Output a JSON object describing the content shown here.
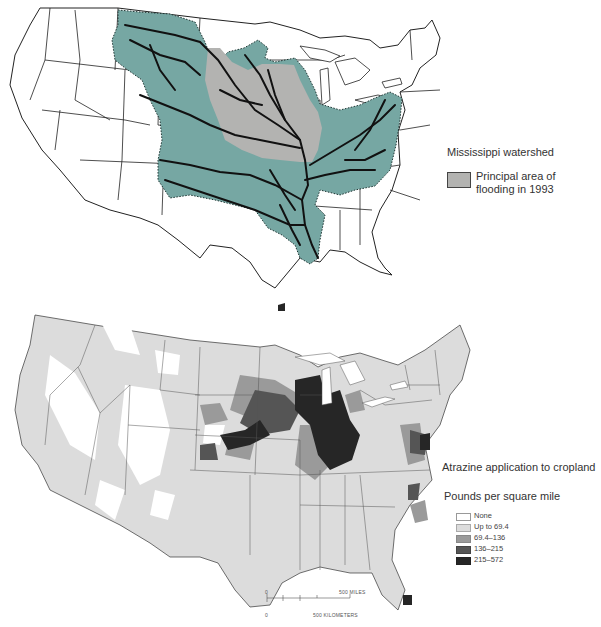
{
  "top_map": {
    "title": "Mississippi watershed",
    "legend": {
      "watershed_label": "Mississippi watershed",
      "flood_label_line1": "Principal area of",
      "flood_label_line2": "flooding in 1993"
    },
    "colors": {
      "watershed": "#76a7a3",
      "flood_area": "#b3b3b1",
      "rivers": "#111111",
      "borders": "#222222"
    }
  },
  "bottom_map": {
    "title": "Atrazine application to cropland",
    "subtitle": "Pounds per square mile",
    "legend": [
      {
        "label": "None",
        "color": "#ffffff"
      },
      {
        "label": "Up to 69.4",
        "color": "#dcdcdc"
      },
      {
        "label": "69.4–136",
        "color": "#9a9a9a"
      },
      {
        "label": "136–215",
        "color": "#555555"
      },
      {
        "label": "215–572",
        "color": "#262626"
      }
    ],
    "scale_bar": {
      "miles_zero": "0",
      "miles_label": "500 MILES",
      "km_zero": "0",
      "km_label": "500 KILOMETERS"
    }
  }
}
